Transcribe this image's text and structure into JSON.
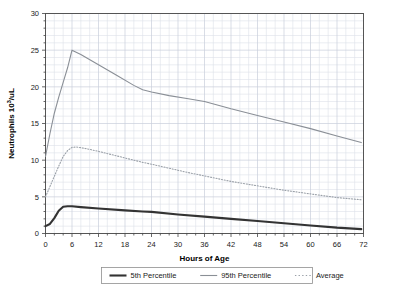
{
  "chart_data": {
    "type": "line",
    "title": "",
    "xlabel": "Hours of Age",
    "ylabel": "Neutrophils 10³/uL",
    "ylabel_base": "Neutrophils 10",
    "ylabel_exp": "3",
    "ylabel_tail": "/uL",
    "xlim": [
      0,
      72
    ],
    "ylim": [
      0,
      30
    ],
    "xticks": [
      0,
      6,
      12,
      18,
      24,
      30,
      36,
      42,
      48,
      54,
      60,
      66,
      72
    ],
    "xtick_labels": [
      "0",
      "6",
      "12",
      "18",
      "24",
      "30",
      "36",
      "42",
      "48",
      "54",
      "60",
      "66",
      "72"
    ],
    "yticks": [
      0,
      5,
      10,
      15,
      20,
      25,
      30
    ],
    "ytick_labels": [
      "0",
      "5",
      "10",
      "15",
      "20",
      "25",
      "30"
    ],
    "x_minor_step": 2,
    "y_minor_step": 1,
    "grid": true,
    "grid_color": "#c8cedb",
    "grid_minor_color": "#dde1e9",
    "frame_color": "#555555",
    "legend_position": "below",
    "series": [
      {
        "name": "5th Percentile",
        "style": "solid",
        "color": "#333333",
        "width": 2.1,
        "x": [
          0,
          1,
          2,
          3,
          4,
          5,
          6,
          8,
          12,
          18,
          22,
          24,
          30,
          36,
          42,
          48,
          54,
          60,
          66,
          71.5
        ],
        "values": [
          1.0,
          1.3,
          2.1,
          3.1,
          3.65,
          3.72,
          3.72,
          3.6,
          3.4,
          3.15,
          3.0,
          2.95,
          2.6,
          2.3,
          2.0,
          1.7,
          1.4,
          1.1,
          0.8,
          0.6
        ]
      },
      {
        "name": "95th Percentile",
        "style": "solid",
        "color": "#8a8f96",
        "width": 1.1,
        "x": [
          0,
          1,
          2,
          3,
          4,
          5,
          6,
          8,
          12,
          16,
          20,
          22,
          24,
          28,
          32,
          36,
          42,
          48,
          54,
          60,
          66,
          71.5
        ],
        "values": [
          10.5,
          13.6,
          16.4,
          18.6,
          20.6,
          22.6,
          25.0,
          24.4,
          23.0,
          21.6,
          20.2,
          19.6,
          19.3,
          18.8,
          18.4,
          18.0,
          17.0,
          16.1,
          15.2,
          14.3,
          13.3,
          12.4
        ]
      },
      {
        "name": "Average",
        "style": "dotted",
        "color": "#9aa0a8",
        "width": 1.1,
        "x": [
          0,
          1,
          2,
          3,
          4,
          5,
          6,
          7,
          9,
          12,
          16,
          20,
          22,
          24,
          28,
          32,
          36,
          42,
          48,
          54,
          60,
          66,
          71.5
        ],
        "values": [
          5.0,
          6.4,
          7.8,
          9.2,
          10.5,
          11.3,
          11.75,
          11.8,
          11.6,
          11.2,
          10.6,
          10.0,
          9.7,
          9.45,
          8.9,
          8.35,
          7.85,
          7.1,
          6.5,
          5.9,
          5.4,
          4.9,
          4.6
        ]
      }
    ],
    "legend": [
      {
        "label": "5th Percentile",
        "style": "solid",
        "color": "#333333",
        "width": 2.1
      },
      {
        "label": "95th Percentile",
        "style": "solid",
        "color": "#8a8f96",
        "width": 1.1
      },
      {
        "label": "Average",
        "style": "dotted",
        "color": "#9aa0a8",
        "width": 1.1
      }
    ]
  }
}
